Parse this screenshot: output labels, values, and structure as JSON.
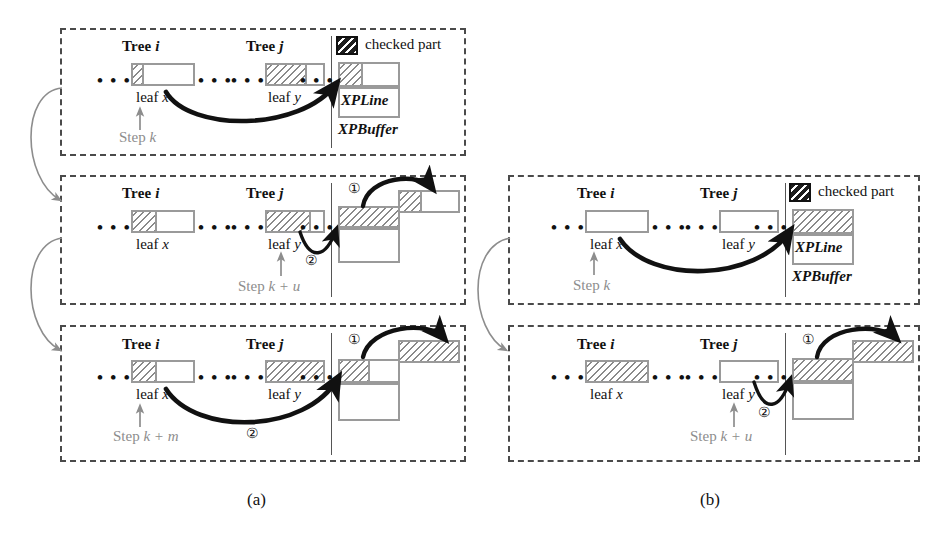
{
  "figure": {
    "subcaption_a": "(a)",
    "subcaption_b": "(b)"
  },
  "legend": {
    "swatch_name": "checked-part-swatch",
    "label": "checked part"
  },
  "labels": {
    "tree_i": "Tree ",
    "tree_i_var": "i",
    "tree_j": "Tree ",
    "tree_j_var": "j",
    "leaf_x": "leaf ",
    "leaf_x_var": "x",
    "leaf_y": "leaf ",
    "leaf_y_var": "y",
    "xpline": "XPLine",
    "xpbuffer": "XPBuffer",
    "marker_one": "①",
    "marker_two": "②"
  },
  "steps": {
    "k": "Step ",
    "k_var": "k",
    "k_plus_u": "Step ",
    "k_plus_u_var": "k + u",
    "k_plus_m": "Step ",
    "k_plus_m_var": "k + m"
  },
  "panels_a": [
    {
      "id": "a1",
      "step_text": "Step ",
      "step_var": "k",
      "tree_i_label": "Tree ",
      "tree_i_var": "i",
      "tree_j_label": "Tree ",
      "tree_j_var": "j",
      "leaf_x_label": "leaf ",
      "leaf_x_var": "x",
      "leaf_y_label": "leaf ",
      "leaf_y_var": "y",
      "leaf_x_fill_fraction": 0.18,
      "leaf_y_fill_fraction": 0.72,
      "has_legend": true,
      "xpline_label": "XPLine",
      "xpbuffer_label": "XPBuffer",
      "markers": []
    },
    {
      "id": "a2",
      "step_text": "Step ",
      "step_var": "k + u",
      "tree_i_label": "Tree ",
      "tree_i_var": "i",
      "tree_j_label": "Tree ",
      "tree_j_var": "j",
      "leaf_x_label": "leaf ",
      "leaf_x_var": "x",
      "leaf_y_label": "leaf ",
      "leaf_y_var": "y",
      "leaf_x_fill_fraction": 0.4,
      "leaf_y_fill_fraction": 0.78,
      "has_legend": false,
      "markers": [
        "①",
        "②"
      ]
    },
    {
      "id": "a3",
      "step_text": "Step ",
      "step_var": "k + m",
      "tree_i_label": "Tree ",
      "tree_i_var": "i",
      "tree_j_label": "Tree ",
      "tree_j_var": "j",
      "leaf_x_label": "leaf ",
      "leaf_x_var": "x",
      "leaf_y_label": "leaf ",
      "leaf_y_var": "y",
      "leaf_x_fill_fraction": 0.4,
      "leaf_y_fill_fraction": 1.0,
      "has_legend": false,
      "markers": [
        "①",
        "②"
      ]
    }
  ],
  "panels_b": [
    {
      "id": "b1",
      "step_text": "Step ",
      "step_var": "k",
      "tree_i_label": "Tree ",
      "tree_i_var": "i",
      "tree_j_label": "Tree ",
      "tree_j_var": "j",
      "leaf_x_label": "leaf ",
      "leaf_x_var": "x",
      "leaf_y_label": "leaf ",
      "leaf_y_var": "y",
      "leaf_x_fill_fraction": 0.0,
      "leaf_y_fill_fraction": 0.0,
      "has_legend": true,
      "xpline_label": "XPLine",
      "xpbuffer_label": "XPBuffer",
      "markers": []
    },
    {
      "id": "b2",
      "step_text": "Step ",
      "step_var": "k + u",
      "tree_i_label": "Tree ",
      "tree_i_var": "i",
      "tree_j_label": "Tree ",
      "tree_j_var": "j",
      "leaf_x_label": "leaf ",
      "leaf_x_var": "x",
      "leaf_y_label": "leaf ",
      "leaf_y_var": "y",
      "leaf_x_fill_fraction": 1.0,
      "leaf_y_fill_fraction": 0.0,
      "has_legend": false,
      "markers": [
        "①",
        "②"
      ]
    }
  ],
  "ellipsis": "• • •",
  "colors": {
    "panel_border": "#4a4a4a",
    "box_border": "#9a9a9a",
    "hatch_line": "#8a8a8a",
    "arrow_dark": "#111111",
    "arrow_light": "#8d8d8d",
    "step_text": "#8d8d8d"
  }
}
